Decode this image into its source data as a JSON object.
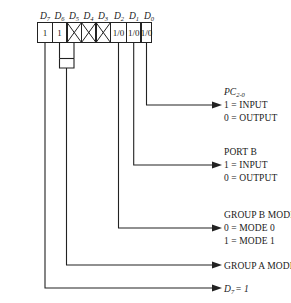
{
  "diagram": {
    "stroke_color": "#222222",
    "text_color": "#1a1a1a",
    "background": "#ffffff"
  },
  "bitfield": {
    "headers": [
      {
        "name": "D",
        "sub": "7"
      },
      {
        "name": "D",
        "sub": "6"
      },
      {
        "name": "D",
        "sub": "5"
      },
      {
        "name": "D",
        "sub": "4"
      },
      {
        "name": "D",
        "sub": "3"
      },
      {
        "name": "D",
        "sub": "2"
      },
      {
        "name": "D",
        "sub": "1"
      },
      {
        "name": "D",
        "sub": "0"
      }
    ],
    "cells": [
      {
        "bit": "D7",
        "value": "1",
        "crossed": false
      },
      {
        "bit": "D6",
        "value": "1",
        "crossed": false
      },
      {
        "bit": "D5",
        "value": "",
        "crossed": true
      },
      {
        "bit": "D4",
        "value": "",
        "crossed": true
      },
      {
        "bit": "D3",
        "value": "",
        "crossed": true
      },
      {
        "bit": "D2",
        "value": "1/0",
        "crossed": false
      },
      {
        "bit": "D1",
        "value": "1/0",
        "crossed": false
      },
      {
        "bit": "D0",
        "value": "1/0",
        "crossed": false
      }
    ]
  },
  "callouts": [
    {
      "id": "pc20",
      "source_bit": "D0",
      "heading": "PC",
      "heading_sub": "2-0",
      "heading_italic": true,
      "lines": [
        "1  =  INPUT",
        "0  =  OUTPUT"
      ]
    },
    {
      "id": "port-b",
      "source_bit": "D1",
      "heading": "PORT B",
      "heading_sub": "",
      "heading_italic": false,
      "lines": [
        "1  =  INPUT",
        "0  =  OUTPUT"
      ]
    },
    {
      "id": "group-b-mode",
      "source_bit": "D2",
      "heading": "GROUP B MODE",
      "heading_sub": "",
      "heading_italic": false,
      "lines": [
        "0  =  MODE 0",
        "1  =  MODE 1"
      ]
    },
    {
      "id": "group-a-mode-2",
      "source_bit": "D6-D5",
      "heading": "",
      "heading_sub": "",
      "heading_italic": false,
      "lines": [
        "GROUP A MODE 2"
      ]
    },
    {
      "id": "d7-equals-1",
      "source_bit": "D7",
      "heading": "",
      "heading_sub": "",
      "heading_italic": true,
      "lines": [
        "D7 = 1"
      ],
      "italic_prefix": "D",
      "italic_sub": "7",
      "italic_rest": "= 1"
    }
  ]
}
